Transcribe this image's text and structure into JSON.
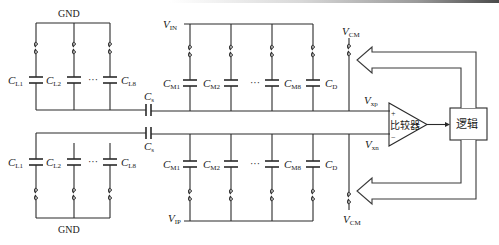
{
  "diagram": {
    "type": "SAR ADC capacitive DAC with comparator (differential)",
    "labels": {
      "gnd_top": "GND",
      "gnd_bottom": "GND",
      "vin": "V",
      "vin_sub": "IN",
      "vip": "V",
      "vip_sub": "IP",
      "vcm_top": "V",
      "vcm_top_sub": "CM",
      "vcm_bottom": "V",
      "vcm_bottom_sub": "CM",
      "vxp": "V",
      "vxp_sub": "xp",
      "vxn": "V",
      "vxn_sub": "xn",
      "cs_top": "C",
      "cs_top_sub": "s",
      "cs_bottom": "C",
      "cs_bottom_sub": "s",
      "comparator": "比较器",
      "logic": "逻辑",
      "plus": "+",
      "minus": "−",
      "ellipsis": "···"
    },
    "lsb_array": {
      "caps": [
        {
          "main": "C",
          "sub": "L1"
        },
        {
          "main": "C",
          "sub": "L2"
        },
        {
          "main": "C",
          "sub": "L8"
        }
      ]
    },
    "msb_array": {
      "caps": [
        {
          "main": "C",
          "sub": "M1"
        },
        {
          "main": "C",
          "sub": "M2"
        },
        {
          "main": "C",
          "sub": "M8"
        },
        {
          "main": "C",
          "sub": "D"
        }
      ]
    },
    "colors": {
      "line": "#2a2a2a",
      "background": "#ffffff"
    }
  }
}
